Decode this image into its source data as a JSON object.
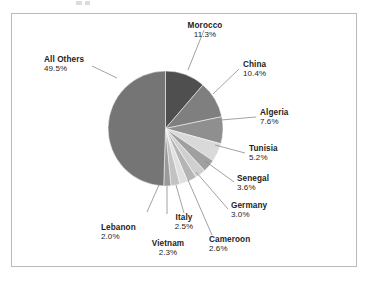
{
  "figure": {
    "background_color": "#ffffff",
    "frame_color": "#b9b9b9",
    "label_text_color": "#1d1d1d",
    "leader_line_color": "#8a8a8a"
  },
  "chart_data": {
    "type": "pie",
    "title": "",
    "subtitle": "",
    "xlabel": "",
    "ylabel": "",
    "legend_position": "none",
    "grid": false,
    "units": "percent",
    "total": 100.0,
    "start_angle_deg": 90,
    "direction": "clockwise",
    "categories": [
      "Morocco",
      "China",
      "Algeria",
      "Tunisia",
      "Senegal",
      "Germany",
      "Cameroon",
      "Vietnam",
      "Italy",
      "Lebanon",
      "All Others"
    ],
    "values": [
      11.3,
      10.4,
      7.6,
      5.2,
      3.6,
      3.0,
      2.6,
      2.3,
      2.5,
      2.0,
      49.5
    ],
    "slice_colors": [
      "#4f4f4f",
      "#7f7f7f",
      "#8f8f8f",
      "#d9d9d9",
      "#a0a0a0",
      "#cfcfcf",
      "#b4b4b4",
      "#e0e0e0",
      "#c2c2c2",
      "#9a9a9a",
      "#757575"
    ],
    "slices": [
      {
        "label": "Morocco",
        "value": 11.3,
        "display": "11.3%",
        "color": "#4f4f4f"
      },
      {
        "label": "China",
        "value": 10.4,
        "display": "10.4%",
        "color": "#7f7f7f"
      },
      {
        "label": "Algeria",
        "value": 7.6,
        "display": "7.6%",
        "color": "#8f8f8f"
      },
      {
        "label": "Tunisia",
        "value": 5.2,
        "display": "5.2%",
        "color": "#d9d9d9"
      },
      {
        "label": "Senegal",
        "value": 3.6,
        "display": "3.6%",
        "color": "#a0a0a0"
      },
      {
        "label": "Germany",
        "value": 3.0,
        "display": "3.0%",
        "color": "#cfcfcf"
      },
      {
        "label": "Cameroon",
        "value": 2.6,
        "display": "2.6%",
        "color": "#b4b4b4"
      },
      {
        "label": "Vietnam",
        "value": 2.3,
        "display": "2.3%",
        "color": "#e0e0e0"
      },
      {
        "label": "Italy",
        "value": 2.5,
        "display": "2.5%",
        "color": "#c2c2c2"
      },
      {
        "label": "Lebanon",
        "value": 2.0,
        "display": "2.0%",
        "color": "#9a9a9a"
      },
      {
        "label": "All Others",
        "value": 49.5,
        "display": "49.5%",
        "color": "#757575"
      }
    ]
  },
  "labels": {
    "morocco": {
      "name": "Morocco",
      "pct": "11.3%"
    },
    "china": {
      "name": "China",
      "pct": "10.4%"
    },
    "algeria": {
      "name": "Algeria",
      "pct": "7.6%"
    },
    "tunisia": {
      "name": "Tunisia",
      "pct": "5.2%"
    },
    "senegal": {
      "name": "Senegal",
      "pct": "3.6%"
    },
    "germany": {
      "name": "Germany",
      "pct": "3.0%"
    },
    "cameroon": {
      "name": "Cameroon",
      "pct": "2.6%"
    },
    "vietnam": {
      "name": "Vietnam",
      "pct": "2.3%"
    },
    "italy": {
      "name": "Italy",
      "pct": "2.5%"
    },
    "lebanon": {
      "name": "Lebanon",
      "pct": "2.0%"
    },
    "allothers": {
      "name": "All Others",
      "pct": "49.5%"
    }
  }
}
